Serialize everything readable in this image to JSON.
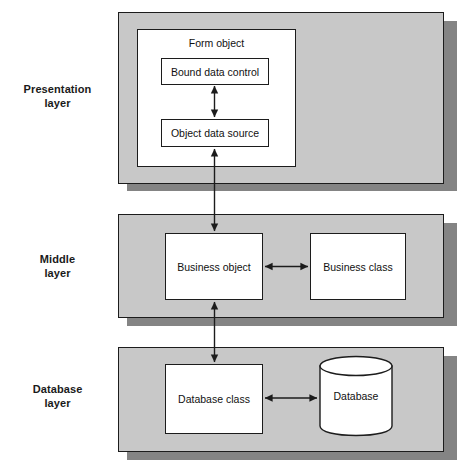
{
  "diagram": {
    "background_color": "#ffffff",
    "panel_fill": "#c8c8c8",
    "panel_border": "#1c1c1c",
    "panel_shadow": "#848484",
    "box_fill": "#ffffff",
    "arrow_color": "#1c1c1c"
  },
  "layers": [
    {
      "id": "presentation",
      "label_line1": "Presentation",
      "label_line2": "layer",
      "container": {
        "name": "Form object"
      },
      "nodes": [
        {
          "id": "bound-data-control",
          "label": "Bound data control"
        },
        {
          "id": "object-data-source",
          "label": "Object data source"
        }
      ]
    },
    {
      "id": "middle",
      "label_line1": "Middle",
      "label_line2": "layer",
      "nodes": [
        {
          "id": "business-object",
          "label": "Business object"
        },
        {
          "id": "business-class",
          "label": "Business class"
        }
      ]
    },
    {
      "id": "database",
      "label_line1": "Database",
      "label_line2": "layer",
      "nodes": [
        {
          "id": "database-class",
          "label": "Database class"
        },
        {
          "id": "database-cylinder",
          "label": "Database",
          "shape": "cylinder"
        }
      ]
    }
  ],
  "connections": [
    {
      "id": "bound-to-source",
      "from": "bound-data-control",
      "to": "object-data-source",
      "direction": "bidirectional",
      "orientation": "vertical"
    },
    {
      "id": "source-to-business-object",
      "from": "object-data-source",
      "to": "business-object",
      "direction": "bidirectional",
      "orientation": "vertical"
    },
    {
      "id": "business-object-to-class",
      "from": "business-object",
      "to": "business-class",
      "direction": "bidirectional",
      "orientation": "horizontal"
    },
    {
      "id": "business-object-to-database-class",
      "from": "business-object",
      "to": "database-class",
      "direction": "bidirectional",
      "orientation": "vertical"
    },
    {
      "id": "database-class-to-database",
      "from": "database-class",
      "to": "database-cylinder",
      "direction": "bidirectional",
      "orientation": "horizontal"
    }
  ]
}
